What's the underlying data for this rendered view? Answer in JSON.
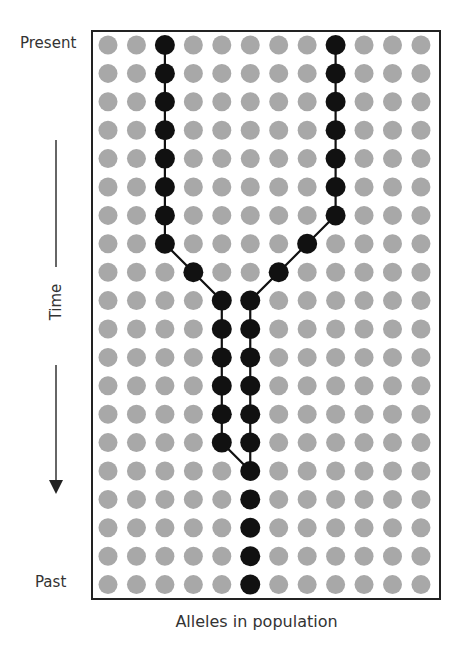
{
  "diagram": {
    "type": "coalescent-genealogy",
    "labels": {
      "top": "Present",
      "bottom": "Past",
      "axis_y": "Time",
      "axis_x": "Alleles in population"
    },
    "grid": {
      "columns": 12,
      "rows": 20,
      "origin_x": 108,
      "origin_y": 45,
      "spacing_x": 28.45,
      "spacing_y": 28.4,
      "dot_radius": 9.5
    },
    "colors": {
      "background_dot": "#a8a8a8",
      "lineage_dot": "#111111",
      "lineage_line": "#111111",
      "frame": "#222222",
      "text": "#333333"
    },
    "lineages": [
      {
        "name": "left-lineage",
        "path": [
          [
            2,
            0
          ],
          [
            2,
            1
          ],
          [
            2,
            2
          ],
          [
            2,
            3
          ],
          [
            2,
            4
          ],
          [
            2,
            5
          ],
          [
            2,
            6
          ],
          [
            2,
            7
          ],
          [
            3,
            8
          ],
          [
            4,
            9
          ],
          [
            4,
            10
          ],
          [
            4,
            11
          ],
          [
            4,
            12
          ],
          [
            4,
            13
          ],
          [
            4,
            14
          ],
          [
            5,
            15
          ]
        ]
      },
      {
        "name": "right-lineage",
        "path": [
          [
            8,
            0
          ],
          [
            8,
            1
          ],
          [
            8,
            2
          ],
          [
            8,
            3
          ],
          [
            8,
            4
          ],
          [
            8,
            5
          ],
          [
            8,
            6
          ],
          [
            7,
            7
          ],
          [
            6,
            8
          ],
          [
            5,
            9
          ],
          [
            5,
            10
          ],
          [
            5,
            11
          ],
          [
            5,
            12
          ],
          [
            5,
            13
          ],
          [
            5,
            14
          ],
          [
            5,
            15
          ]
        ]
      },
      {
        "name": "ancestral-lineage",
        "path": [
          [
            5,
            15
          ],
          [
            5,
            16
          ],
          [
            5,
            17
          ],
          [
            5,
            18
          ],
          [
            5,
            19
          ]
        ],
        "connected": false
      }
    ],
    "coalescence_point": [
      5,
      15
    ]
  }
}
